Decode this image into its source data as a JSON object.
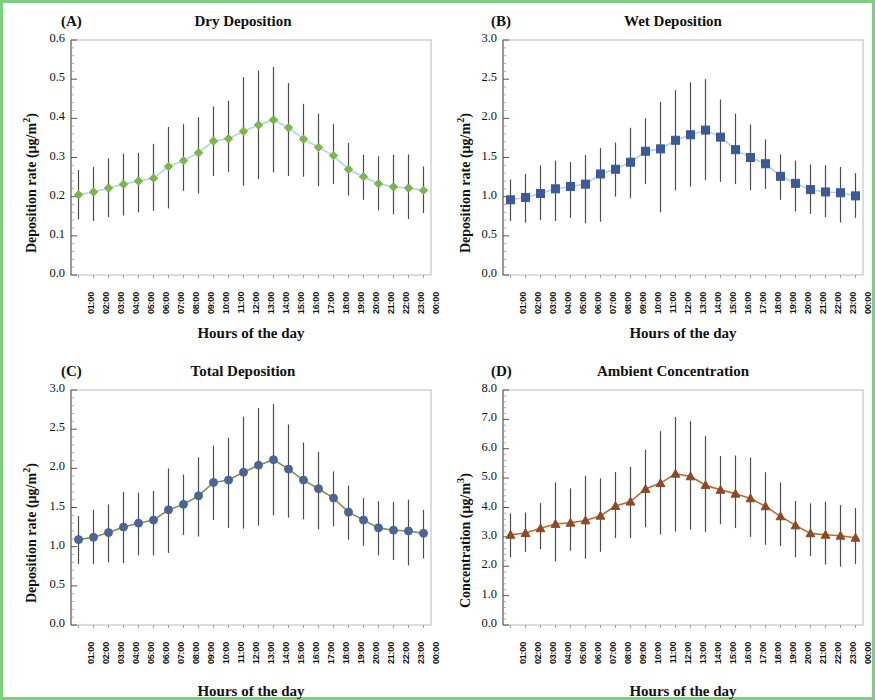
{
  "figure": {
    "border_color": "#7fce7f",
    "background": "#ffffff"
  },
  "common": {
    "xlabel": "Hours of the day",
    "hours": [
      "01:00",
      "02:00",
      "03:00",
      "04:00",
      "05:00",
      "06:00",
      "07:00",
      "08:00",
      "09:00",
      "10:00",
      "11:00",
      "12:00",
      "13:00",
      "14:00",
      "15:00",
      "16:00",
      "17:00",
      "18:00",
      "19:00",
      "20:00",
      "21:00",
      "22:00",
      "23:00",
      "00:00"
    ],
    "ylabel_deposition": "Deposition rate (µg/m²)",
    "ylabel_concentration": "Concentration (µg/m³)",
    "errorbar_color": "#4d4d4d"
  },
  "panels": [
    {
      "tag": "(A)",
      "title": "Dry Deposition"
    },
    {
      "tag": "(B)",
      "title": "Wet Deposition"
    },
    {
      "tag": "(C)",
      "title": "Total Deposition"
    },
    {
      "tag": "(D)",
      "title": "Ambient Concentration"
    }
  ],
  "chart_data": [
    {
      "type": "line",
      "panel": "(A)",
      "title": "Dry Deposition",
      "xlabel": "Hours of the day",
      "ylabel": "Deposition rate (µg/m²)",
      "categories": [
        "01:00",
        "02:00",
        "03:00",
        "04:00",
        "05:00",
        "06:00",
        "07:00",
        "08:00",
        "09:00",
        "10:00",
        "11:00",
        "12:00",
        "13:00",
        "14:00",
        "15:00",
        "16:00",
        "17:00",
        "18:00",
        "19:00",
        "20:00",
        "21:00",
        "22:00",
        "23:00",
        "00:00"
      ],
      "values": [
        0.205,
        0.212,
        0.222,
        0.232,
        0.24,
        0.247,
        0.277,
        0.292,
        0.312,
        0.342,
        0.348,
        0.367,
        0.383,
        0.396,
        0.376,
        0.347,
        0.326,
        0.305,
        0.27,
        0.251,
        0.233,
        0.225,
        0.222,
        0.216
      ],
      "err_low": [
        0.142,
        0.138,
        0.148,
        0.152,
        0.16,
        0.164,
        0.17,
        0.215,
        0.208,
        0.253,
        0.263,
        0.228,
        0.245,
        0.262,
        0.253,
        0.251,
        0.227,
        0.232,
        0.203,
        0.192,
        0.165,
        0.155,
        0.143,
        0.158
      ],
      "err_high": [
        0.268,
        0.276,
        0.298,
        0.31,
        0.312,
        0.335,
        0.378,
        0.385,
        0.403,
        0.43,
        0.445,
        0.505,
        0.522,
        0.531,
        0.49,
        0.437,
        0.412,
        0.385,
        0.337,
        0.307,
        0.303,
        0.307,
        0.308,
        0.277
      ],
      "ylim": [
        0.0,
        0.6
      ],
      "yticks": [
        "0.0",
        "0.1",
        "0.2",
        "0.3",
        "0.4",
        "0.5",
        "0.6"
      ],
      "marker": "diamond",
      "marker_color": "#7ab648",
      "line_color": "#a9d6ea",
      "grid": false,
      "legend": "none"
    },
    {
      "type": "line",
      "panel": "(B)",
      "title": "Wet Deposition",
      "xlabel": "Hours of the day",
      "ylabel": "Deposition rate (µg/m²)",
      "categories": [
        "01:00",
        "02:00",
        "03:00",
        "04:00",
        "05:00",
        "06:00",
        "07:00",
        "08:00",
        "09:00",
        "10:00",
        "11:00",
        "12:00",
        "13:00",
        "14:00",
        "15:00",
        "16:00",
        "17:00",
        "18:00",
        "19:00",
        "20:00",
        "21:00",
        "22:00",
        "23:00",
        "00:00"
      ],
      "values": [
        0.96,
        0.99,
        1.04,
        1.1,
        1.13,
        1.16,
        1.29,
        1.35,
        1.44,
        1.58,
        1.61,
        1.72,
        1.79,
        1.85,
        1.76,
        1.6,
        1.5,
        1.42,
        1.26,
        1.17,
        1.09,
        1.06,
        1.05,
        1.01
      ],
      "err_low": [
        0.69,
        0.67,
        0.7,
        0.69,
        0.73,
        0.66,
        0.68,
        1.0,
        0.98,
        1.16,
        0.8,
        1.08,
        1.13,
        1.21,
        1.19,
        1.16,
        1.08,
        1.1,
        0.96,
        0.81,
        0.78,
        0.74,
        0.67,
        0.73
      ],
      "err_high": [
        1.22,
        1.29,
        1.4,
        1.46,
        1.44,
        1.53,
        1.62,
        1.69,
        1.88,
        2.0,
        2.21,
        2.36,
        2.46,
        2.5,
        2.24,
        2.06,
        1.92,
        1.73,
        1.54,
        1.46,
        1.41,
        1.4,
        1.38,
        1.3
      ],
      "ylim": [
        0.0,
        3.0
      ],
      "yticks": [
        "0.0",
        "0.5",
        "1.0",
        "1.5",
        "2.0",
        "2.5",
        "3.0"
      ],
      "marker": "square",
      "marker_color": "#3a5a99",
      "line_color": "#b9cde4",
      "grid": false,
      "legend": "none"
    },
    {
      "type": "line",
      "panel": "(C)",
      "title": "Total Deposition",
      "xlabel": "Hours of the day",
      "ylabel": "Deposition rate (µg/m²)",
      "categories": [
        "01:00",
        "02:00",
        "03:00",
        "04:00",
        "05:00",
        "06:00",
        "07:00",
        "08:00",
        "09:00",
        "10:00",
        "11:00",
        "12:00",
        "13:00",
        "14:00",
        "15:00",
        "16:00",
        "17:00",
        "18:00",
        "19:00",
        "20:00",
        "21:00",
        "22:00",
        "23:00",
        "00:00"
      ],
      "values": [
        1.09,
        1.12,
        1.18,
        1.25,
        1.3,
        1.34,
        1.47,
        1.54,
        1.65,
        1.82,
        1.85,
        1.95,
        2.04,
        2.11,
        1.99,
        1.85,
        1.74,
        1.62,
        1.44,
        1.34,
        1.24,
        1.21,
        1.2,
        1.17
      ],
      "err_low": [
        0.78,
        0.78,
        0.8,
        0.79,
        0.89,
        0.89,
        0.92,
        1.15,
        1.13,
        1.34,
        1.24,
        1.23,
        1.27,
        1.4,
        1.37,
        1.35,
        1.22,
        1.26,
        1.09,
        1.01,
        0.89,
        0.83,
        0.76,
        0.85
      ],
      "err_high": [
        1.39,
        1.47,
        1.54,
        1.7,
        1.69,
        1.71,
        2.0,
        1.92,
        2.14,
        2.29,
        2.39,
        2.66,
        2.77,
        2.82,
        2.56,
        2.33,
        2.21,
        1.96,
        1.78,
        1.62,
        1.58,
        1.57,
        1.6,
        1.47
      ],
      "ylim": [
        0.0,
        3.0
      ],
      "yticks": [
        "0.0",
        "0.5",
        "1.0",
        "1.5",
        "2.0",
        "2.5",
        "3.0"
      ],
      "marker": "circle",
      "marker_color": "#4a6596",
      "line_color": "#86904a",
      "grid": false,
      "legend": "none"
    },
    {
      "type": "line",
      "panel": "(D)",
      "title": "Ambient Concentration",
      "xlabel": "Hours of the day",
      "ylabel": "Concentration (µg/m³)",
      "categories": [
        "01:00",
        "02:00",
        "03:00",
        "04:00",
        "05:00",
        "06:00",
        "07:00",
        "08:00",
        "09:00",
        "10:00",
        "11:00",
        "12:00",
        "13:00",
        "14:00",
        "15:00",
        "16:00",
        "17:00",
        "18:00",
        "19:00",
        "20:00",
        "21:00",
        "22:00",
        "23:00",
        "00:00"
      ],
      "values": [
        3.07,
        3.13,
        3.29,
        3.44,
        3.48,
        3.56,
        3.72,
        4.05,
        4.2,
        4.63,
        4.83,
        5.15,
        5.06,
        4.76,
        4.6,
        4.47,
        4.31,
        4.04,
        3.7,
        3.39,
        3.12,
        3.07,
        3.04,
        2.97
      ],
      "err_low": [
        2.31,
        2.49,
        2.58,
        2.17,
        2.53,
        2.26,
        2.49,
        2.96,
        2.96,
        3.33,
        3.09,
        3.18,
        3.25,
        3.17,
        3.43,
        3.3,
        3.0,
        2.73,
        2.69,
        2.31,
        2.35,
        2.06,
        1.99,
        2.08
      ],
      "err_high": [
        3.8,
        3.83,
        4.15,
        4.85,
        4.65,
        5.08,
        4.99,
        5.21,
        5.38,
        5.97,
        6.6,
        7.08,
        6.94,
        6.43,
        5.75,
        5.77,
        5.7,
        5.2,
        4.85,
        4.22,
        4.14,
        4.2,
        4.08,
        3.98
      ],
      "ylim": [
        0.0,
        8.0
      ],
      "yticks": [
        "0.0",
        "1.0",
        "2.0",
        "3.0",
        "4.0",
        "5.0",
        "6.0",
        "7.0",
        "8.0"
      ],
      "marker": "triangle",
      "marker_color": "#8a4b25",
      "line_color": "#c06a2d",
      "grid": false,
      "legend": "none"
    }
  ]
}
